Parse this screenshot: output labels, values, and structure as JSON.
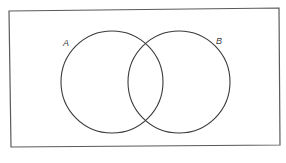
{
  "diagram": {
    "type": "venn",
    "universe": {
      "shape": "rectangle",
      "points": [
        [
          9,
          11
        ],
        [
          279,
          8
        ],
        [
          280,
          145
        ],
        [
          11,
          147
        ]
      ],
      "stroke": "#5a5a5a"
    },
    "sets": [
      {
        "label": "A",
        "cx": 112,
        "cy": 82,
        "r": 51,
        "label_x": 63,
        "label_y": 46,
        "stroke": "#3a3a3a"
      },
      {
        "label": "B",
        "cx": 179,
        "cy": 82,
        "r": 51,
        "label_x": 216,
        "label_y": 44,
        "stroke": "#3a3a3a"
      }
    ]
  }
}
